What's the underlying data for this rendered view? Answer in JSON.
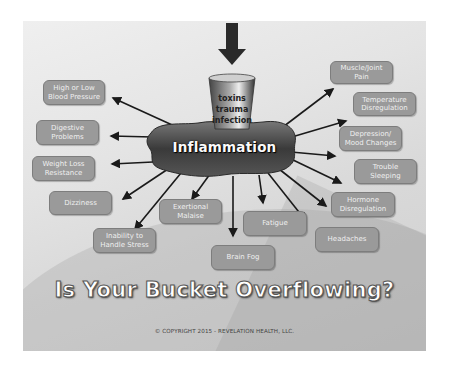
{
  "slide": {
    "bucket_label": "toxins\ntrauma\ninfection",
    "center_label": "Inflammation",
    "title": "Is Your Bucket Overflowing?",
    "copyright": "© COPYRIGHT 2015 - REVELATION HEALTH, LLC.",
    "colors": {
      "box_fill": "#9a9a9a",
      "box_text": "#efefef",
      "background": "#e0e0e0",
      "arrow": "#1a1a1a"
    },
    "symptoms_left": [
      {
        "label": "High or Low\nBlood Pressure"
      },
      {
        "label": "Digestive\nProblems"
      },
      {
        "label": "Weight Loss\nResistance"
      },
      {
        "label": "Dizziness"
      },
      {
        "label": "Inability to\nHandle Stress"
      }
    ],
    "symptoms_bottom": [
      {
        "label": "Exertional\nMalaise"
      },
      {
        "label": "Brain Fog"
      },
      {
        "label": "Fatigue"
      }
    ],
    "symptoms_right": [
      {
        "label": "Muscle/Joint\nPain"
      },
      {
        "label": "Temperature\nDisregulation"
      },
      {
        "label": "Depression/\nMood Changes"
      },
      {
        "label": "Trouble\nSleeping"
      },
      {
        "label": "Hormone\nDisregulation"
      },
      {
        "label": "Headaches"
      }
    ]
  }
}
